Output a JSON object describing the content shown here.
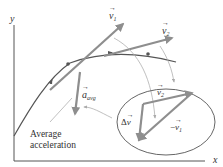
{
  "diagram": {
    "axes": {
      "x_label": "x",
      "y_label": "y"
    },
    "vectors": {
      "v1": {
        "symbol": "v",
        "subscript": "1"
      },
      "v2": {
        "symbol": "v",
        "subscript": "2"
      },
      "a_avg": {
        "symbol": "a",
        "subscript": "avg"
      },
      "delta_v": {
        "prefix": "Δ",
        "symbol": "v"
      },
      "neg_v1": {
        "prefix": "−",
        "symbol": "v",
        "subscript": "1"
      }
    },
    "caption": {
      "line1": "Average",
      "line2": "acceleration"
    },
    "colors": {
      "vector": "#8e8e8e",
      "path": "#555555",
      "axis": "#555555",
      "leader": "#b0b0b0"
    }
  }
}
